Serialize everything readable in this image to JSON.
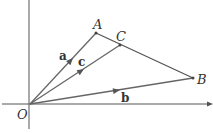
{
  "diagram": {
    "points": {
      "O": {
        "label": "O",
        "x": 30,
        "y": 104
      },
      "A": {
        "label": "A",
        "x": 96,
        "y": 33
      },
      "B": {
        "label": "B",
        "x": 193,
        "y": 78
      },
      "C": {
        "label": "C",
        "x": 120,
        "y": 45
      }
    },
    "vectors": {
      "a": {
        "label": "a",
        "from": "O",
        "to": "A"
      },
      "b": {
        "label": "b",
        "from": "O",
        "to": "B"
      },
      "c": {
        "label": "c",
        "from": "O",
        "to": "C"
      }
    },
    "segments": [
      {
        "from": "A",
        "to": "B"
      }
    ],
    "colors": {
      "line": "#555555",
      "text": "#333333"
    }
  }
}
